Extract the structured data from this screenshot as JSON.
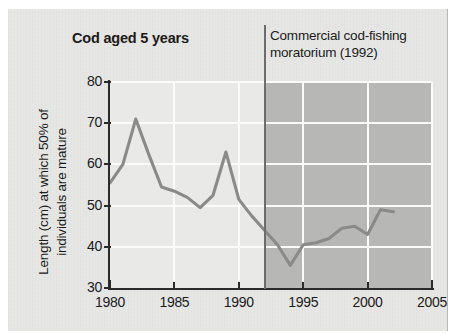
{
  "figure": {
    "title": "Cod aged 5 years",
    "annotation_lines": [
      "Commercial cod-fishing",
      "moratorium (1992)"
    ],
    "ylabel_lines": [
      "Length (cm) at which 50% of",
      "individuals are mature"
    ]
  },
  "colors": {
    "panel_background": "#e7e7e5",
    "plot_background": "#e9e9e7",
    "shaded_region": "#b7b7b5",
    "gridline": "#fbfbfa",
    "axis": "#2a2a2a",
    "series_line": "#8a8a8a",
    "marker_line": "#6d6d6d",
    "text": "#1b1b1b"
  },
  "chart_data": {
    "type": "line",
    "title": "Cod aged 5 years",
    "xlabel": "",
    "ylabel": "Length (cm) at which 50% of individuals are mature",
    "xlim": [
      1980,
      2005
    ],
    "ylim": [
      30,
      80
    ],
    "xticks": [
      1980,
      1985,
      1990,
      1995,
      2000,
      2005
    ],
    "yticks": [
      30,
      40,
      50,
      60,
      70,
      80
    ],
    "xtick_labels": [
      "1980",
      "1985",
      "1990",
      "1995",
      "2000",
      "2005"
    ],
    "ytick_labels": [
      "30",
      "40",
      "50",
      "60",
      "70",
      "80"
    ],
    "grid": true,
    "legend": null,
    "annotations": [
      {
        "text": "Commercial cod-fishing moratorium (1992)",
        "type": "vertical-line-with-label",
        "x": 1992
      }
    ],
    "shaded_regions": [
      {
        "x_start": 1992,
        "x_end": 2005,
        "color": "#b7b7b5",
        "label": "moratorium period"
      }
    ],
    "x": [
      1980,
      1981,
      1982,
      1983,
      1984,
      1985,
      1986,
      1987,
      1988,
      1989,
      1990,
      1991,
      1992,
      1993,
      1994,
      1995,
      1996,
      1997,
      1998,
      1999,
      2000,
      2001,
      2002
    ],
    "values": [
      55.5,
      60.0,
      71.0,
      62.5,
      54.5,
      53.5,
      52.0,
      49.5,
      52.5,
      63.0,
      51.5,
      47.5,
      44.0,
      40.5,
      35.5,
      40.5,
      41.0,
      42.0,
      44.5,
      45.0,
      43.0,
      49.0,
      48.5
    ],
    "series": [
      {
        "name": "Length at 50% maturity",
        "values": [
          55.5,
          60.0,
          71.0,
          62.5,
          54.5,
          53.5,
          52.0,
          49.5,
          52.5,
          63.0,
          51.5,
          47.5,
          44.0,
          40.5,
          35.5,
          40.5,
          41.0,
          42.0,
          44.5,
          45.0,
          43.0,
          49.0,
          48.5
        ]
      }
    ]
  }
}
